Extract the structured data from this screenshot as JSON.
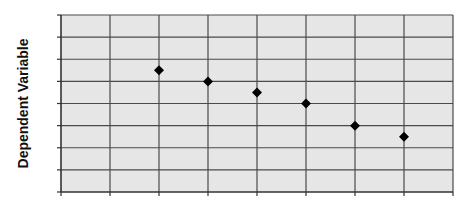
{
  "chart_data": {
    "type": "scatter",
    "title": "",
    "xlabel": "",
    "ylabel": "Dependent Variable",
    "xlim": [
      0,
      8
    ],
    "ylim": [
      0,
      8
    ],
    "x_major_step": 1,
    "y_major_step": 1,
    "grid": true,
    "tick_labels_shown": false,
    "legend": "none",
    "marker": "diamond",
    "colors": {
      "plot_background": "#e6e6e6",
      "grid": "#4a4a4a",
      "marker": "#000000"
    },
    "series": [
      {
        "name": "data",
        "x": [
          2,
          3,
          4,
          5,
          6,
          7
        ],
        "y": [
          5.5,
          5.0,
          4.5,
          4.0,
          3.0,
          2.5
        ]
      }
    ]
  }
}
